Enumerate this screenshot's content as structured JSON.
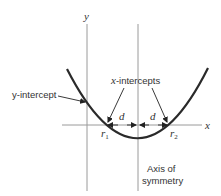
{
  "diagram": {
    "axes": {
      "x_label": "x",
      "y_label": "y"
    },
    "labels": {
      "y_intercept": "y-intercept",
      "x_intercepts_var": "x",
      "x_intercepts_rest": "-intercepts",
      "distance_left": "d",
      "distance_right": "d",
      "root1": "r",
      "root1_sub": "1",
      "root2": "r",
      "root2_sub": "2",
      "axis_line1": "Axis of",
      "axis_line2": "symmetry"
    },
    "colors": {
      "curve": "#2a2a2a",
      "axes": "#9a9a9a",
      "text": "#333333",
      "arrows": "#222222"
    }
  }
}
